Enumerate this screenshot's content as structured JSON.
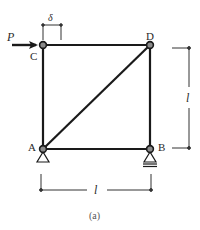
{
  "figure": {
    "caption": "(a)",
    "nodes": {
      "A": {
        "label": "A"
      },
      "B": {
        "label": "B"
      },
      "C": {
        "label": "C"
      },
      "D": {
        "label": "D"
      }
    },
    "load": {
      "label": "P",
      "node": "C",
      "direction": "right"
    },
    "displacement": {
      "label": "δ"
    },
    "dimensions": {
      "height": {
        "label": "l"
      },
      "width": {
        "label": "l"
      }
    },
    "supports": {
      "A": "pin",
      "B": "roller"
    },
    "colors": {
      "member": "#1a1a1a",
      "node_fill": "#8a8a8a",
      "dimension": "#333333"
    }
  }
}
